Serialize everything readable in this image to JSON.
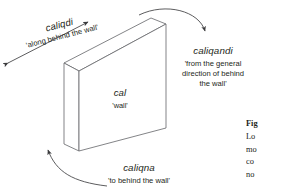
{
  "figure": {
    "type": "linguistic-spatial-case-diagram",
    "object": {
      "term": "cal",
      "gloss": "'wall'"
    },
    "labels": [
      {
        "id": "caliqdi",
        "term": "caliqdi",
        "gloss": "'along behind the wall'",
        "arrow": "double-headed-straight",
        "position": "upper-left-rotated"
      },
      {
        "id": "caliqandi",
        "term": "caliqandi",
        "gloss_lines": [
          "'from the general",
          "direction of behind",
          "the wall'"
        ],
        "arrow": "curved-from-wall-top",
        "position": "right"
      },
      {
        "id": "caliqna",
        "term": "caliqna",
        "gloss": "'to behind the wall'",
        "arrow": "curved-to-behind-wall",
        "position": "bottom"
      }
    ],
    "caption": {
      "head": "Fig",
      "lines": [
        "Lo",
        "mo",
        "co",
        "no"
      ]
    },
    "colors": {
      "stroke": "#58595b",
      "text": "#231f20",
      "background": "#ffffff",
      "face_fill": "#ffffff"
    }
  }
}
